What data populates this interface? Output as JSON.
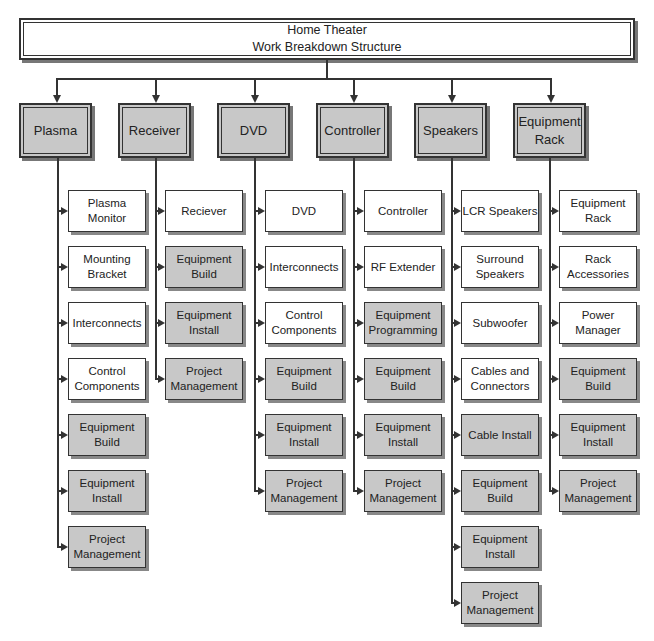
{
  "root": {
    "line1": "Home Theater",
    "line2": "Work Breakdown Structure"
  },
  "colors": {
    "fill_gray": "#c8c8c8",
    "line": "#333333",
    "white": "#ffffff"
  },
  "columns": [
    {
      "label": "Plasma",
      "items": [
        {
          "label": "Plasma Monitor",
          "gray": false
        },
        {
          "label": "Mounting Bracket",
          "gray": false
        },
        {
          "label": "Interconnects",
          "gray": false
        },
        {
          "label": "Control Components",
          "gray": false
        },
        {
          "label": "Equipment Build",
          "gray": true
        },
        {
          "label": "Equipment Install",
          "gray": true
        },
        {
          "label": "Project Management",
          "gray": true
        }
      ]
    },
    {
      "label": "Receiver",
      "items": [
        {
          "label": "Reciever",
          "gray": false
        },
        {
          "label": "Equipment Build",
          "gray": true
        },
        {
          "label": "Equipment Install",
          "gray": true
        },
        {
          "label": "Project Management",
          "gray": true
        }
      ]
    },
    {
      "label": "DVD",
      "items": [
        {
          "label": "DVD",
          "gray": false
        },
        {
          "label": "Interconnects",
          "gray": false
        },
        {
          "label": "Control Components",
          "gray": false
        },
        {
          "label": "Equipment Build",
          "gray": true
        },
        {
          "label": "Equipment Install",
          "gray": true
        },
        {
          "label": "Project Management",
          "gray": true
        }
      ]
    },
    {
      "label": "Controller",
      "items": [
        {
          "label": "Controller",
          "gray": false
        },
        {
          "label": "RF Extender",
          "gray": false
        },
        {
          "label": "Equipment Programming",
          "gray": true
        },
        {
          "label": "Equipment Build",
          "gray": true
        },
        {
          "label": "Equipment Install",
          "gray": true
        },
        {
          "label": "Project Management",
          "gray": true
        }
      ]
    },
    {
      "label": "Speakers",
      "items": [
        {
          "label": "LCR Speakers",
          "gray": false
        },
        {
          "label": "Surround Speakers",
          "gray": false
        },
        {
          "label": "Subwoofer",
          "gray": false
        },
        {
          "label": "Cables and Connectors",
          "gray": false
        },
        {
          "label": "Cable Install",
          "gray": true
        },
        {
          "label": "Equipment Build",
          "gray": true
        },
        {
          "label": "Equipment Install",
          "gray": true
        },
        {
          "label": "Project Management",
          "gray": true
        }
      ]
    },
    {
      "label": "Equipment Rack",
      "items": [
        {
          "label": "Equipment Rack",
          "gray": false
        },
        {
          "label": "Rack Accessories",
          "gray": false
        },
        {
          "label": "Power Manager",
          "gray": false
        },
        {
          "label": "Equipment Build",
          "gray": true
        },
        {
          "label": "Equipment Install",
          "gray": true
        },
        {
          "label": "Project Management",
          "gray": true
        }
      ]
    }
  ]
}
